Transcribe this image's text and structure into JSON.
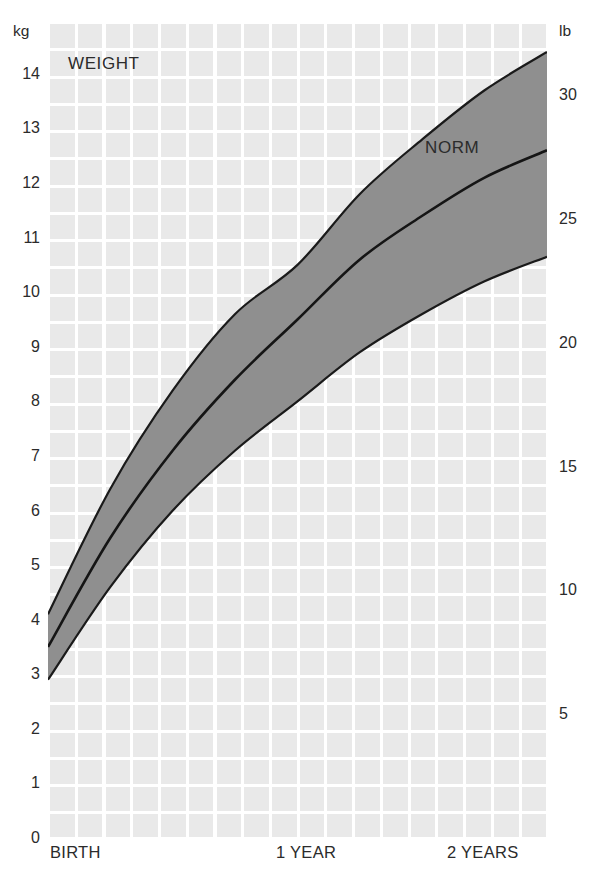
{
  "chart_data": {
    "type": "area",
    "title": "WEIGHT",
    "annotations": [
      "NORM"
    ],
    "xlabel": "",
    "ylabel": "kg",
    "ylabel_secondary": "lb",
    "x": [
      0,
      0.25,
      0.5,
      0.75,
      1,
      1.25,
      1.5,
      1.75,
      2
    ],
    "x_unit": "years",
    "xlim": [
      0,
      2
    ],
    "ylim": [
      0,
      14.95
    ],
    "ylim_secondary": [
      0,
      33
    ],
    "grid": true,
    "legend_position": "none",
    "series": [
      {
        "name": "upper",
        "values": [
          4.1,
          6.4,
          8.2,
          9.6,
          10.5,
          11.8,
          12.8,
          13.7,
          14.4
        ]
      },
      {
        "name": "NORM",
        "values": [
          3.5,
          5.5,
          7.1,
          8.4,
          9.5,
          10.6,
          11.4,
          12.1,
          12.6
        ]
      },
      {
        "name": "lower",
        "values": [
          2.9,
          4.6,
          6.0,
          7.1,
          8.0,
          8.9,
          9.6,
          10.2,
          10.65
        ]
      }
    ],
    "colors": {
      "band": "#8f8f8f",
      "line": "#1a1a1a",
      "plot_background": "#e9e9e9",
      "gridline": "#ffffff",
      "text": "#2b2b2b"
    }
  },
  "axes": {
    "left_unit": "kg",
    "right_unit": "lb",
    "left_ticks": [
      {
        "label": "14",
        "value": 14
      },
      {
        "label": "13",
        "value": 13
      },
      {
        "label": "12",
        "value": 12
      },
      {
        "label": "11",
        "value": 11
      },
      {
        "label": "10",
        "value": 10
      },
      {
        "label": "9",
        "value": 9
      },
      {
        "label": "8",
        "value": 8
      },
      {
        "label": "7",
        "value": 7
      },
      {
        "label": "6",
        "value": 6
      },
      {
        "label": "5",
        "value": 5
      },
      {
        "label": "4",
        "value": 4
      },
      {
        "label": "3",
        "value": 3
      },
      {
        "label": "2",
        "value": 2
      },
      {
        "label": "1",
        "value": 1
      },
      {
        "label": "0",
        "value": 0
      }
    ],
    "right_ticks": [
      {
        "label": "30",
        "value": 30
      },
      {
        "label": "25",
        "value": 25
      },
      {
        "label": "20",
        "value": 20
      },
      {
        "label": "15",
        "value": 15
      },
      {
        "label": "10",
        "value": 10
      },
      {
        "label": "5",
        "value": 5
      }
    ],
    "x_ticks": [
      {
        "label": "BIRTH",
        "value": 0
      },
      {
        "label": "1 YEAR",
        "value": 1
      },
      {
        "label": "2 YEARS",
        "value": 2
      }
    ]
  },
  "labels": {
    "chart_title": "WEIGHT",
    "norm": "NORM"
  }
}
